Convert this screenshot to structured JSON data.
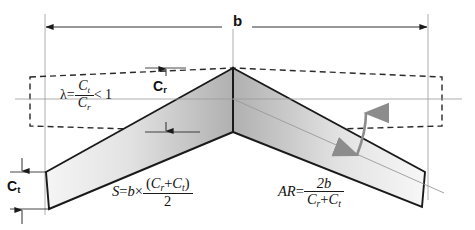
{
  "diagram": {
    "background_color": "#ffffff",
    "stroke_color": "#1a1a1a",
    "dashed_color": "#2a2a2a",
    "thin_line_color": "#9a9a9a",
    "sweep_arrow_color": "#8c8c8c",
    "wing_fill_light": "#f2f2f2",
    "wing_fill_dark": "#b5b5b5"
  },
  "dimensions": {
    "span_label": "b",
    "root_chord_label": "C",
    "root_chord_subscript": "r",
    "tip_chord_label": "C",
    "tip_chord_subscript": "t"
  },
  "formulas": {
    "taper_ratio": {
      "symbol": "λ",
      "equals": "=",
      "numerator": "C",
      "numerator_sub": "t",
      "denominator": "C",
      "denominator_sub": "r",
      "comparison": "< 1",
      "plain": "λ = Ct / Cr < 1"
    },
    "area": {
      "symbol": "S",
      "equals": "=",
      "span": "b",
      "times": "×",
      "numerator_open": "(",
      "numerator_first": "C",
      "numerator_first_sub": "r",
      "numerator_plus": "+",
      "numerator_second": "C",
      "numerator_second_sub": "t",
      "numerator_close": ")",
      "denominator": "2",
      "plain": "S = b × (Cr + Ct) / 2"
    },
    "aspect_ratio": {
      "symbol": "AR",
      "equals": "=",
      "numerator": "2b",
      "denominator_first": "C",
      "denominator_first_sub": "r",
      "denominator_plus": "+",
      "denominator_second": "C",
      "denominator_second_sub": "t",
      "plain": "AR = 2b / (Cr + Ct)"
    }
  },
  "geometry": {
    "apex_x": 233,
    "apex_y": 68,
    "root_chord_bottom_y": 132,
    "left_tip_x": 46,
    "right_tip_x": 425,
    "tip_leading_y": 172,
    "tip_trailing_y": 209,
    "span_line_y": 27,
    "span_left_x": 45,
    "span_right_x": 428
  }
}
